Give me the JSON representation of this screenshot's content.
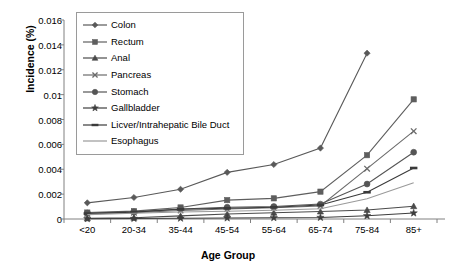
{
  "chart_data": {
    "type": "line",
    "title": "",
    "xlabel": "Age Group",
    "ylabel": "Incidence (%)",
    "categories": [
      "<20",
      "20-34",
      "35-44",
      "45-54",
      "55-64",
      "65-74",
      "75-84",
      "85+"
    ],
    "ylim": [
      0,
      0.016
    ],
    "yticks": [
      "0",
      "0.002",
      "0.004",
      "0.006",
      "0.008",
      "0.01",
      "0.012",
      "0.014",
      "0.016"
    ],
    "ytick_values": [
      0,
      0.002,
      0.004,
      0.006,
      0.008,
      0.01,
      0.012,
      0.014,
      0.016
    ],
    "grid": false,
    "legend_position": "upper-left-inside",
    "series": [
      {
        "name": "Colon",
        "marker": "diamond",
        "color": "#595959",
        "values": [
          0.0013,
          0.00173,
          0.00239,
          0.00375,
          0.00438,
          0.0057,
          0.01333,
          null
        ]
      },
      {
        "name": "Rectum",
        "marker": "square",
        "color": "#5e5e5e",
        "values": [
          0.00052,
          0.00063,
          0.00093,
          0.00152,
          0.00166,
          0.0022,
          0.00513,
          0.00962
        ]
      },
      {
        "name": "Anal",
        "marker": "triangle",
        "color": "#4a4a4a",
        "values": [
          5e-05,
          0.0001,
          0.00025,
          0.0004,
          0.0005,
          0.0006,
          0.00072,
          0.00103
        ]
      },
      {
        "name": "Pancreas",
        "marker": "cross",
        "color": "#6b6b6b",
        "values": [
          0.0004,
          0.0005,
          0.00068,
          0.0008,
          0.0009,
          0.00105,
          0.00405,
          0.00706
        ]
      },
      {
        "name": "Stomach",
        "marker": "circle",
        "color": "#555555",
        "values": [
          0.00048,
          0.00058,
          0.0008,
          0.00095,
          0.001,
          0.0012,
          0.00281,
          0.00537
        ]
      },
      {
        "name": "Gallbladder",
        "marker": "star",
        "color": "#3d3d3d",
        "values": [
          2e-05,
          4e-05,
          6e-05,
          8e-05,
          0.0001,
          0.00012,
          0.00026,
          0.00048
        ]
      },
      {
        "name": "Licver/Intrahepatic Bile Duct",
        "marker": "dash",
        "color": "#3a3a3a",
        "values": [
          0.00044,
          0.00055,
          0.00078,
          0.00086,
          0.00094,
          0.00112,
          0.00215,
          0.0041
        ]
      },
      {
        "name": "Esophagus",
        "marker": "line",
        "color": "#9a9a9a",
        "values": [
          0.00035,
          0.00046,
          0.00056,
          0.00062,
          0.0007,
          0.00082,
          0.00163,
          0.00291
        ]
      }
    ]
  },
  "axis": {
    "y_title": "Incidence (%)",
    "x_title": "Age Group"
  }
}
